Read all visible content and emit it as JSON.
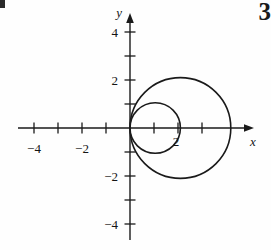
{
  "page": {
    "page_number": "3",
    "background_color": "#fefefe",
    "ink_color": "#1a1a1a"
  },
  "axes": {
    "x_axis_label": "x",
    "y_axis_label": "y",
    "x_tick_labels": [
      "−4",
      "−2",
      "2"
    ],
    "y_tick_labels": [
      "4",
      "2",
      "−2",
      "−4"
    ],
    "origin_px": {
      "x": 130,
      "y": 128
    },
    "unit_px": 24
  },
  "chart_data": {
    "type": "line",
    "title": "",
    "xlabel": "x",
    "ylabel": "y",
    "grid": false,
    "legend": false,
    "xlim": [
      -5.4,
      5.8
    ],
    "ylim": [
      -5.0,
      5.2
    ],
    "xticks": [
      -5,
      -4,
      -3,
      -2,
      -1,
      1,
      2,
      3,
      4
    ],
    "yticks": [
      -5,
      -4,
      -3,
      -2,
      -1,
      1,
      2,
      3,
      4
    ],
    "xtick_labels_shown": {
      "-4": "−4",
      "-2": "−2",
      "2": "2"
    },
    "ytick_labels_shown": {
      "4": "4",
      "2": "2",
      "-2": "−2",
      "-4": "−4"
    },
    "series": [
      {
        "name": "r = 4 cos θ",
        "shape": "circle",
        "center": [
          2.1,
          0
        ],
        "radius": 2.1,
        "color": "#1a1a1a",
        "linewidth": 1.6,
        "x_intercepts": [
          0,
          4.2
        ],
        "y_extent": [
          -2.1,
          2.1
        ]
      },
      {
        "name": "r = 2 cos θ",
        "shape": "circle",
        "center": [
          1.05,
          0
        ],
        "radius": 1.05,
        "color": "#1a1a1a",
        "linewidth": 1.6,
        "x_intercepts": [
          0,
          2.1
        ],
        "y_extent": [
          -1.05,
          1.05
        ]
      }
    ],
    "annotations": [
      {
        "text": "2",
        "x": 1.85,
        "y": -0.42,
        "note": "label near small circle x-intercept"
      }
    ]
  }
}
